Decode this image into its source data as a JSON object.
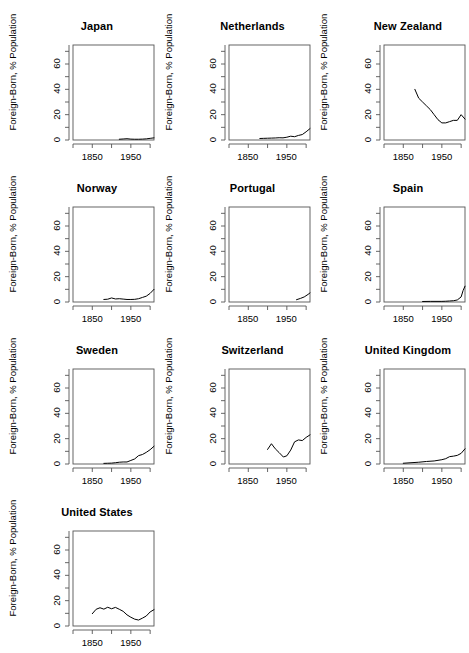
{
  "chart_data": {
    "type": "line",
    "title": "",
    "xlabel": "",
    "ylabel": "Foreign-Born, % Population",
    "xlim": [
      1800,
      2010
    ],
    "ylim": [
      0,
      75
    ],
    "grid": false,
    "legend": "none",
    "layout": "small-multiples 3 columns x 4 rows",
    "y_ticks_major": [
      0,
      20,
      40,
      60
    ],
    "y_tick_labels": [
      "0",
      "20",
      "40",
      "60"
    ],
    "y_ticks_minor": [
      10,
      30,
      50,
      70
    ],
    "x_ticks": [
      1800,
      1850,
      1900,
      1950,
      2000
    ],
    "x_tick_labels": [
      "",
      "1850",
      "",
      "1950",
      ""
    ],
    "axis_color": "#555555",
    "line_color": "#000000",
    "background": "#ffffff",
    "panels": [
      {
        "name": "Japan",
        "x": [
          1920,
          1930,
          1940,
          1950,
          1960,
          1970,
          1980,
          1990,
          2000,
          2010
        ],
        "y": [
          0.6,
          0.8,
          1.0,
          0.7,
          0.6,
          0.6,
          0.7,
          0.9,
          1.3,
          1.7
        ]
      },
      {
        "name": "Netherlands",
        "x": [
          1880,
          1890,
          1900,
          1910,
          1920,
          1930,
          1940,
          1950,
          1960,
          1970,
          1980,
          1990,
          2000,
          2010
        ],
        "y": [
          1.2,
          1.3,
          1.4,
          1.5,
          1.6,
          1.8,
          1.7,
          2.2,
          3.0,
          2.6,
          3.6,
          4.3,
          6.5,
          9.0,
          11.0
        ]
      },
      {
        "name": "New Zealand",
        "x": [
          1880,
          1890,
          1900,
          1910,
          1920,
          1930,
          1940,
          1950,
          1960,
          1970,
          1980,
          1990,
          2000,
          2010
        ],
        "y": [
          40.0,
          33.0,
          30.0,
          27.0,
          24.0,
          20.0,
          16.0,
          13.5,
          13.5,
          14.5,
          15.5,
          15.5,
          20.0,
          16.5
        ]
      },
      {
        "name": "Norway",
        "x": [
          1880,
          1890,
          1900,
          1910,
          1920,
          1930,
          1940,
          1950,
          1960,
          1970,
          1980,
          1990,
          2000,
          2010
        ],
        "y": [
          2.0,
          2.2,
          3.2,
          2.4,
          2.6,
          2.3,
          2.0,
          2.0,
          2.1,
          2.6,
          3.6,
          4.6,
          6.8,
          10.0
        ]
      },
      {
        "name": "Portugal",
        "x": [
          1975,
          1985,
          1995,
          2005,
          2010
        ],
        "y": [
          1.8,
          2.8,
          4.0,
          6.0,
          7.2
        ]
      },
      {
        "name": "Spain",
        "x": [
          1900,
          1920,
          1940,
          1950,
          1960,
          1970,
          1980,
          1990,
          2000,
          2005,
          2010
        ],
        "y": [
          0.4,
          0.5,
          0.5,
          0.5,
          0.6,
          0.8,
          1.0,
          1.6,
          4.0,
          9.0,
          12.5
        ]
      },
      {
        "name": "Sweden",
        "x": [
          1880,
          1890,
          1900,
          1910,
          1920,
          1930,
          1940,
          1950,
          1960,
          1970,
          1980,
          1990,
          2000,
          2010
        ],
        "y": [
          0.5,
          0.6,
          0.7,
          1.0,
          1.4,
          1.6,
          1.6,
          2.8,
          4.0,
          6.6,
          7.5,
          9.2,
          11.3,
          14.0
        ]
      },
      {
        "name": "Switzerland",
        "x": [
          1900,
          1910,
          1920,
          1930,
          1941,
          1950,
          1960,
          1970,
          1980,
          1990,
          2000,
          2010
        ],
        "y": [
          11.5,
          16.0,
          12.0,
          9.0,
          5.5,
          6.5,
          11.0,
          17.5,
          19.0,
          18.5,
          21.0,
          23.0
        ]
      },
      {
        "name": "United Kingdom",
        "x": [
          1850,
          1870,
          1890,
          1910,
          1930,
          1950,
          1960,
          1970,
          1980,
          1990,
          2000,
          2010
        ],
        "y": [
          0.6,
          1.0,
          1.4,
          2.0,
          2.4,
          3.4,
          4.2,
          5.8,
          6.2,
          6.8,
          8.4,
          12.0
        ]
      },
      {
        "name": "United States",
        "x": [
          1850,
          1860,
          1870,
          1880,
          1890,
          1900,
          1910,
          1920,
          1930,
          1940,
          1950,
          1960,
          1970,
          1980,
          1990,
          2000,
          2010
        ],
        "y": [
          9.7,
          13.2,
          14.4,
          13.3,
          14.8,
          13.6,
          14.7,
          13.2,
          11.6,
          8.8,
          6.9,
          5.4,
          4.7,
          6.2,
          7.9,
          11.1,
          12.9
        ]
      }
    ]
  }
}
